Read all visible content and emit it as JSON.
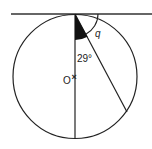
{
  "diagram": {
    "type": "circle-theorem",
    "labels": {
      "angle_known": "29°",
      "angle_unknown": "q",
      "centre": "O",
      "centre_mark": "×"
    },
    "colors": {
      "stroke": "#222222",
      "fill_angle": "#111111",
      "background": "#ffffff"
    }
  }
}
